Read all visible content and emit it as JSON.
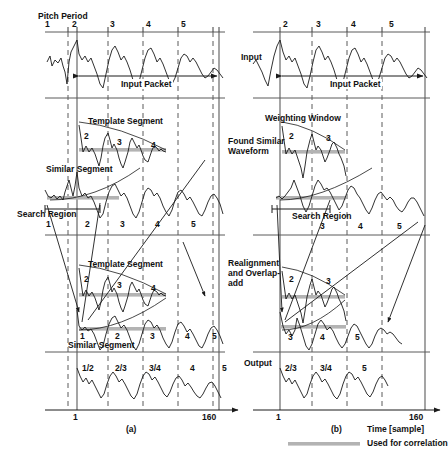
{
  "figure": {
    "caption_a": "(a)",
    "caption_b": "(b)",
    "axis_label": "Time [sample]",
    "axis_start": "1",
    "axis_end": "160",
    "legend_text": "Used for correlation",
    "legend_color": "#b3b3b3",
    "line_color": "#1a1a1a",
    "grid_color": "#555555"
  },
  "pitch_period": {
    "title": "Pitch Period",
    "ticks_a": [
      "1",
      "2",
      "3",
      "4",
      "5"
    ],
    "ticks_b": [
      "2",
      "3",
      "4",
      "5"
    ]
  },
  "rows": {
    "input": {
      "label": "Input",
      "packet_label": "Input Packet"
    },
    "found_similar": {
      "label": "Found Similar\nWaveform",
      "a_annotations": {
        "template": "Template Segment",
        "similar": "Similar Segment",
        "search": "Search Region",
        "template_periods": [
          "2",
          "3",
          "4"
        ],
        "similar_periods": [
          "1",
          "2",
          "3",
          "4",
          "5"
        ]
      },
      "b_annotations": {
        "weighting": "Weighting Window",
        "search": "Search Region",
        "template_periods": [
          "2",
          "3"
        ],
        "similar_periods": [
          "3",
          "4",
          "5"
        ]
      }
    },
    "realignment": {
      "label": "Realignment\nand Overlap-\nadd",
      "a_annotations": {
        "template": "Template Segment",
        "similar": "Similar Segment",
        "template_periods": [
          "2",
          "3",
          "4"
        ],
        "similar_periods": [
          "1",
          "2",
          "3",
          "4",
          "5"
        ]
      },
      "b_annotations": {
        "template_periods": [
          "2",
          "3"
        ],
        "similar_periods": [
          "3",
          "4",
          "5"
        ]
      }
    },
    "output": {
      "label": "Output",
      "a_periods": [
        "1/2",
        "2/3",
        "3/4",
        "4",
        "5"
      ],
      "b_periods": [
        "2/3",
        "3/4",
        "5"
      ]
    }
  }
}
